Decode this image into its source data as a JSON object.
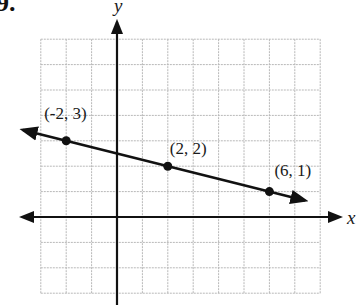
{
  "problem": {
    "number": "9."
  },
  "chart_data": {
    "type": "line",
    "title": "",
    "xlabel": "x",
    "ylabel": "y",
    "xlim": [
      -3,
      8
    ],
    "ylim": [
      -3,
      7
    ],
    "grid": true,
    "points": [
      {
        "x": -2,
        "y": 3,
        "label": "(-2, 3)"
      },
      {
        "x": 2,
        "y": 2,
        "label": "(2, 2)"
      },
      {
        "x": 6,
        "y": 1,
        "label": "(6, 1)"
      }
    ],
    "line": {
      "slope": -0.25,
      "intercept": 2.5,
      "arrows": "both"
    }
  },
  "colors": {
    "grid": "#b8b8b8",
    "ink": "#111111"
  }
}
